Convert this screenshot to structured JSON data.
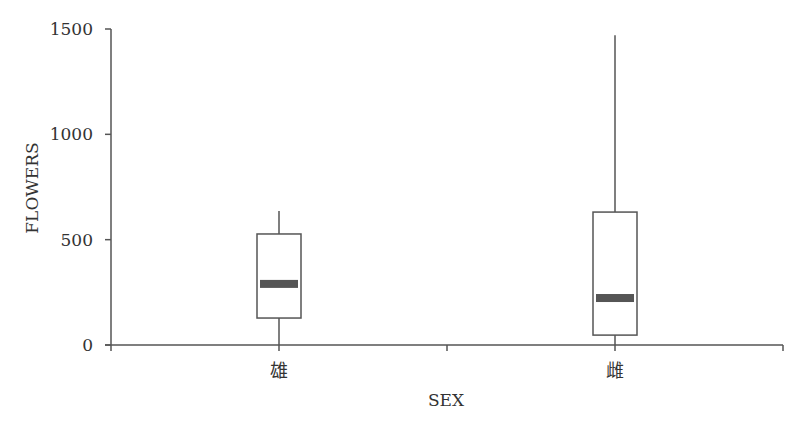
{
  "chart_data": {
    "type": "box",
    "title": "",
    "xlabel": "SEX",
    "ylabel": "FLOWERS",
    "ylim": [
      0,
      1500
    ],
    "yticks": [
      0,
      500,
      1000,
      1500
    ],
    "ytick_labels": [
      "0",
      "500",
      "1000",
      "1500"
    ],
    "grid": false,
    "legend": null,
    "categories": [
      "雄",
      "雌"
    ],
    "series": [
      {
        "name": "雄",
        "whisker_low": 0,
        "q1": 128,
        "median": 290,
        "q3": 527,
        "whisker_high": 636
      },
      {
        "name": "雌",
        "whisker_low": 0,
        "q1": 47,
        "median": 223,
        "q3": 631,
        "whisker_high": 1470
      }
    ]
  },
  "colors": {
    "axis": "#555555",
    "box_stroke": "#555555",
    "box_fill": "#ffffff",
    "median": "#555555"
  }
}
